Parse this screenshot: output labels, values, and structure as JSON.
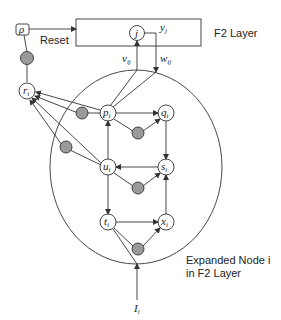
{
  "diagram": {
    "f2_layer_label": "F2 Layer",
    "reset_label": "Reset",
    "rho_label": "ρ",
    "j_label": "j",
    "y_label": "y",
    "y_sub": "j",
    "v_label": "v",
    "v_sub": "ij",
    "w_label": "w",
    "w_sub": "ij",
    "expanded_line1": "Expanded Node i",
    "expanded_line2": "in F2 Layer",
    "input_label": "I",
    "input_sub": "i",
    "nodes": {
      "r": {
        "label": "r",
        "sub": "i"
      },
      "p": {
        "label": "p",
        "sub": "i"
      },
      "q": {
        "label": "q",
        "sub": "i"
      },
      "u": {
        "label": "u",
        "sub": "i"
      },
      "s": {
        "label": "s",
        "sub": "i"
      },
      "t": {
        "label": "t",
        "sub": "i"
      },
      "x": {
        "label": "x",
        "sub": "i"
      }
    },
    "colors": {
      "gate_fill": "#9a9a9a",
      "stroke": "#333333"
    }
  }
}
